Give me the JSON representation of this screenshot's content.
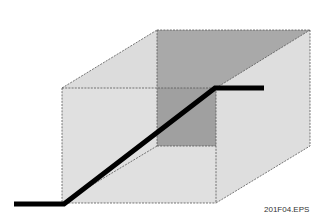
{
  "figure": {
    "caption": "201F04.EPS",
    "colors": {
      "background": "#ffffff",
      "top_face": "#dcdcdc",
      "back_face": "#a9a9a9",
      "front_face": "#d6d6d6",
      "right_face": "#dedede",
      "edge": "#555555",
      "path_line": "#000000"
    },
    "box": {
      "front": {
        "left": 62,
        "top": 88,
        "right": 216,
        "bottom": 203
      },
      "back": {
        "left": 157,
        "top": 30,
        "right": 310,
        "bottom": 146
      }
    },
    "path_points": [
      [
        14,
        204
      ],
      [
        64,
        204
      ],
      [
        215,
        88
      ],
      [
        264,
        88
      ]
    ]
  }
}
